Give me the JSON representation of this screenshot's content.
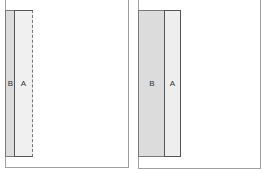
{
  "panels": [
    {
      "name": "before",
      "strips": [
        {
          "label": "B",
          "color": "#dcdcdc"
        },
        {
          "label": "A",
          "color": "#f0f0f0",
          "border": "dashed-right"
        }
      ]
    },
    {
      "name": "after",
      "strips": [
        {
          "label": "B",
          "color": "#dcdcdc"
        },
        {
          "label": "A",
          "color": "#eeeeee"
        }
      ]
    }
  ]
}
